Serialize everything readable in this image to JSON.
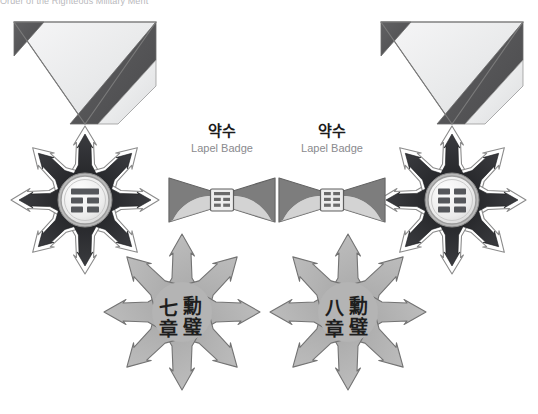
{
  "page": {
    "width": 538,
    "height": 414,
    "background": "#ffffff",
    "clipped_header_text": "Order of the Righteous Military Merit"
  },
  "palette": {
    "ribbon_light": "#e8e9ea",
    "ribbon_light_2": "#f3f3f4",
    "ribbon_dark": "#575757",
    "ribbon_dark_2": "#4c4c4c",
    "ray_dark": "#2f3033",
    "ray_mid": "#6f7175",
    "star_gray": "#b4b4b4",
    "star_gray_edge": "#7c7c7c",
    "medallion_face": "#efefef",
    "medallion_rim": "#9a9a9a",
    "trigram_bar": "#55575b",
    "outline": "#6d6d6d",
    "label_ko": "#1b1b1b",
    "label_en": "#8a8a8e",
    "glyph_dark": "#1e1e1e"
  },
  "medals": [
    {
      "id": "left",
      "name": "left-medal",
      "center_x": 85,
      "suspension_ribbon": {
        "name": "suspension-ribbon",
        "style": "folded-triangle",
        "stripe_order": [
          "dark",
          "light",
          "dark"
        ]
      },
      "breast_star": {
        "name": "breast-star",
        "points": 8,
        "ray_color": "#2f3033"
      },
      "medallion": {
        "name": "center-medallion",
        "trigram_rows": [
          "solid",
          "broken",
          "broken"
        ],
        "trigram_name": "jin"
      },
      "lower_star": {
        "name": "lower-star",
        "points": 8,
        "fill": "#b4b4b4",
        "inscription": {
          "name": "star-inscription",
          "layout": "2x2",
          "characters": [
            "七",
            "勳",
            "章",
            "璧"
          ],
          "reading_order": "top-right, top-left, bottom-right, bottom-left"
        }
      }
    },
    {
      "id": "right",
      "name": "right-medal",
      "center_x": 452,
      "suspension_ribbon": {
        "name": "suspension-ribbon",
        "style": "folded-triangle",
        "stripe_order": [
          "dark",
          "light",
          "dark"
        ]
      },
      "breast_star": {
        "name": "breast-star",
        "points": 8,
        "ray_color": "#2f3033"
      },
      "medallion": {
        "name": "center-medallion",
        "trigram_rows": [
          "broken",
          "broken",
          "broken"
        ],
        "trigram_name": "kun"
      },
      "lower_star": {
        "name": "lower-star",
        "points": 8,
        "fill": "#b4b4b4",
        "inscription": {
          "name": "star-inscription",
          "layout": "2x2",
          "characters": [
            "八",
            "勳",
            "章",
            "璧"
          ],
          "reading_order": "top-right, top-left, bottom-right, bottom-left"
        }
      }
    }
  ],
  "lapel_badges": [
    {
      "id": "lapel-left",
      "name": "lapel-badge-left",
      "title_ko": "약수",
      "title_en": "Lapel Badge",
      "label_x": 167,
      "label_y": 121,
      "badge_cx": 222,
      "badge_cy": 200,
      "trigram_rows": [
        "solid",
        "broken",
        "broken"
      ]
    },
    {
      "id": "lapel-right",
      "name": "lapel-badge-right",
      "title_ko": "약수",
      "title_en": "Lapel Badge",
      "label_x": 277,
      "label_y": 121,
      "badge_cx": 332,
      "badge_cy": 200,
      "trigram_rows": [
        "broken",
        "broken",
        "broken"
      ]
    }
  ]
}
